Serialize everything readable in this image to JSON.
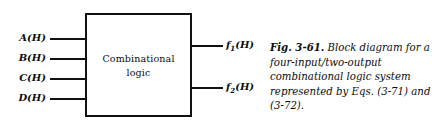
{
  "figure": {
    "block": {
      "label_line1": "Combinational",
      "label_line2": "logic"
    },
    "inputs": [
      {
        "name": "A",
        "suffix": "(H)",
        "full": "A(H)"
      },
      {
        "name": "B",
        "suffix": "(H)",
        "full": "B(H)"
      },
      {
        "name": "C",
        "suffix": "(H)",
        "full": "C(H)"
      },
      {
        "name": "D",
        "suffix": "(H)",
        "full": "D(H)"
      }
    ],
    "outputs": [
      {
        "name": "f",
        "subscript": "1",
        "suffix": "(H)",
        "full": "f1(H)"
      },
      {
        "name": "f",
        "subscript": "2",
        "suffix": "(H)",
        "full": "f2(H)"
      }
    ],
    "caption": {
      "lead": "Fig. 3-61.",
      "text": " Block diagram for a four-input/two-output combinational logic system represented by Eqs. (3-71) and (3-72).",
      "full": "Fig. 3-61. Block diagram for a four-input/two-output combinational logic system represented by Eqs. (3-71) and (3-72)."
    },
    "colors": {
      "ink": "#111111",
      "background": "#ffffff"
    }
  }
}
